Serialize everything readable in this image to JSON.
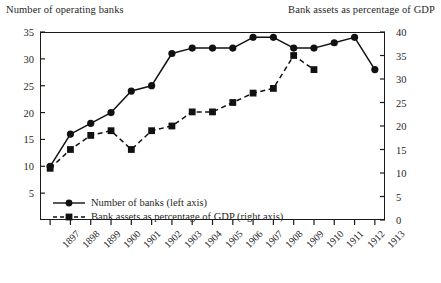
{
  "chart_data": {
    "type": "line",
    "title": "",
    "left_axis_title": "Number of operating banks",
    "right_axis_title": "Bank assets as percentage of GDP",
    "xlabel": "",
    "categories": [
      "1897",
      "1898",
      "1899",
      "1900",
      "1901",
      "1902",
      "1903",
      "1904",
      "1905",
      "1906",
      "1907",
      "1908",
      "1909",
      "1910",
      "1911",
      "1912",
      "1913"
    ],
    "left_ylim": [
      0,
      35
    ],
    "right_ylim": [
      0,
      40
    ],
    "left_yticks": [
      5,
      10,
      15,
      20,
      25,
      30,
      35
    ],
    "right_yticks": [
      0,
      5,
      10,
      15,
      20,
      25,
      30,
      35,
      40
    ],
    "grid": false,
    "legend_position": "inside-bottom-left",
    "series": [
      {
        "name": "Number of banks (left axis)",
        "axis": "left",
        "marker": "circle",
        "line_style": "solid",
        "color": "#111111",
        "values": [
          10,
          16,
          18,
          20,
          24,
          25,
          31,
          32,
          32,
          32,
          34,
          34,
          32,
          32,
          33,
          34,
          28
        ]
      },
      {
        "name": "Bank assets as percentage of GDP (right axis)",
        "axis": "right",
        "marker": "square",
        "line_style": "dashed",
        "color": "#111111",
        "values": [
          11,
          15,
          18,
          19,
          15,
          19,
          20,
          23,
          23,
          25,
          27,
          28,
          35,
          32,
          null,
          null,
          null
        ]
      }
    ]
  },
  "legend": {
    "items": [
      {
        "label": "Number of banks (left axis)"
      },
      {
        "label": "Bank assets as percentage of GDP (right axis)"
      }
    ]
  }
}
